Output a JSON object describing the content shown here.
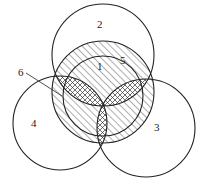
{
  "diagram": {
    "type": "overlapping-circles",
    "labels": [
      {
        "id": "2",
        "text": "2",
        "x": 97,
        "y": 19
      },
      {
        "id": "1",
        "text": "1",
        "x": 97,
        "y": 61
      },
      {
        "id": "5",
        "text": "5",
        "x": 120,
        "y": 55
      },
      {
        "id": "6",
        "text": "6",
        "x": 18,
        "y": 67
      },
      {
        "id": "4",
        "text": "4",
        "x": 31,
        "y": 118
      },
      {
        "id": "3",
        "text": "3",
        "x": 154,
        "y": 122
      }
    ],
    "colors": {
      "stroke": "#222222",
      "background": "#ffffff"
    }
  }
}
